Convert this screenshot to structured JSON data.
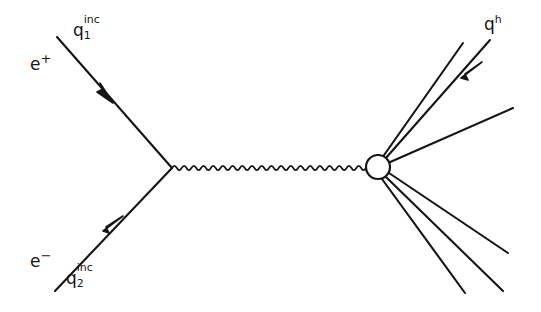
{
  "figure": {
    "kind": "feynman-diagram",
    "process": "e+ e- annihilation into hadrons",
    "background_color": "#ffffff",
    "ink_color": "#141414",
    "width": 541,
    "height": 312
  },
  "labels": {
    "positron": {
      "base": "e",
      "sup": "+",
      "sub": "",
      "x": 30,
      "y": 62
    },
    "incoming_momentum_1": {
      "base": "q",
      "sup": "inc",
      "sub": "1",
      "x": 75,
      "y": 30
    },
    "electron": {
      "base": "e",
      "sup": "−",
      "sub": "",
      "x": 30,
      "y": 258
    },
    "incoming_momentum_2": {
      "base": "q",
      "sup": "inc",
      "sub": "2",
      "x": 68,
      "y": 278
    },
    "hadron_momentum": {
      "base": "q",
      "sup": "h",
      "sub": "",
      "x": 484,
      "y": 18
    }
  },
  "geometry": {
    "left_vertex": {
      "x": 172,
      "y": 168
    },
    "blob": {
      "cx": 378,
      "cy": 167,
      "r": 12
    },
    "positron_line": {
      "x1": 57,
      "y1": 37,
      "x2": 172,
      "y2": 168
    },
    "electron_line": {
      "x1": 55,
      "y1": 291,
      "x2": 172,
      "y2": 168
    },
    "photon_line": {
      "x1": 172,
      "y1": 168,
      "x2": 366,
      "y2": 167
    },
    "positron_arrow": {
      "x": 106,
      "y": 95
    },
    "electron_arrow": {
      "x": 114,
      "y": 225
    },
    "hadron_arrow": {
      "x": 473,
      "y": 72
    },
    "outgoing_lines": [
      {
        "x1": 382,
        "y1": 158,
        "x2": 463,
        "y2": 43
      },
      {
        "x1": 385,
        "y1": 159,
        "x2": 490,
        "y2": 40
      },
      {
        "x1": 388,
        "y1": 163,
        "x2": 513,
        "y2": 108
      },
      {
        "x1": 389,
        "y1": 173,
        "x2": 508,
        "y2": 253
      },
      {
        "x1": 386,
        "y1": 177,
        "x2": 503,
        "y2": 291
      },
      {
        "x1": 382,
        "y1": 179,
        "x2": 465,
        "y2": 293
      }
    ]
  },
  "legend": {
    "photon_style": "wavy",
    "blob_style": "open-circle",
    "line_style": "solid"
  }
}
